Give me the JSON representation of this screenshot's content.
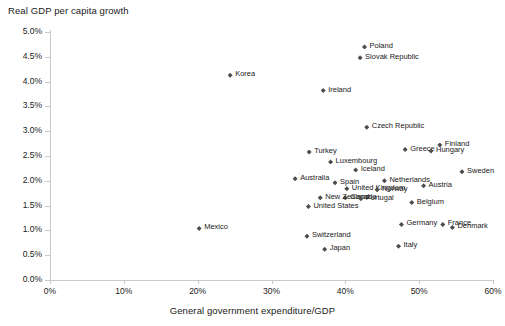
{
  "chart_data": {
    "type": "scatter",
    "title": "Real GDP per capita growth",
    "xlabel": "General government expenditure/GDP",
    "ylabel": "Real GDP per capita growth",
    "xlim": [
      0,
      60
    ],
    "ylim": [
      0,
      5
    ],
    "x_tick_labels": [
      "0%",
      "10%",
      "20%",
      "30%",
      "40%",
      "50%",
      "60%"
    ],
    "x_ticks": [
      0,
      10,
      20,
      30,
      40,
      50,
      60
    ],
    "y_tick_labels": [
      "0.0%",
      "0.5%",
      "1.0%",
      "1.5%",
      "2.0%",
      "2.5%",
      "3.0%",
      "3.5%",
      "4.0%",
      "4.5%",
      "5.0%"
    ],
    "y_ticks": [
      0,
      0.5,
      1.0,
      1.5,
      2.0,
      2.5,
      3.0,
      3.5,
      4.0,
      4.5,
      5.0
    ],
    "grid": false,
    "legend": "none",
    "marker_color": "#4d4d4d",
    "marker_shape": "diamond",
    "axis_color": "#c9c9c9",
    "points": [
      {
        "label": "Poland",
        "x": 42.6,
        "y": 4.7,
        "side": "right"
      },
      {
        "label": "Slovak Republic",
        "x": 42.0,
        "y": 4.48,
        "side": "right"
      },
      {
        "label": "Korea",
        "x": 24.4,
        "y": 4.13,
        "side": "right"
      },
      {
        "label": "Ireland",
        "x": 37.0,
        "y": 3.82,
        "side": "right"
      },
      {
        "label": "Czech Republic",
        "x": 42.9,
        "y": 3.08,
        "side": "right"
      },
      {
        "label": "Finland",
        "x": 52.8,
        "y": 2.72,
        "side": "right"
      },
      {
        "label": "Greece",
        "x": 48.1,
        "y": 2.63,
        "side": "right"
      },
      {
        "label": "Hungary",
        "x": 51.6,
        "y": 2.6,
        "side": "right"
      },
      {
        "label": "Turkey",
        "x": 35.1,
        "y": 2.58,
        "side": "right"
      },
      {
        "label": "Luxembourg",
        "x": 38.0,
        "y": 2.38,
        "side": "right"
      },
      {
        "label": "Iceland",
        "x": 41.4,
        "y": 2.22,
        "side": "right"
      },
      {
        "label": "Sweden",
        "x": 55.8,
        "y": 2.18,
        "side": "right"
      },
      {
        "label": "Australia",
        "x": 33.2,
        "y": 2.04,
        "side": "right"
      },
      {
        "label": "Netherlands",
        "x": 45.3,
        "y": 2.0,
        "side": "right"
      },
      {
        "label": "Spain",
        "x": 38.6,
        "y": 1.96,
        "side": "right"
      },
      {
        "label": "Austria",
        "x": 50.6,
        "y": 1.9,
        "side": "right"
      },
      {
        "label": "United Kingdom",
        "x": 40.2,
        "y": 1.84,
        "side": "right"
      },
      {
        "label": "Norway",
        "x": 44.3,
        "y": 1.82,
        "side": "right"
      },
      {
        "label": "Canada",
        "x": 40.0,
        "y": 1.66,
        "side": "right"
      },
      {
        "label": "New Zealand",
        "x": 36.6,
        "y": 1.66,
        "side": "right"
      },
      {
        "label": "Portugal",
        "x": 42.1,
        "y": 1.64,
        "side": "right"
      },
      {
        "label": "Belgium",
        "x": 49.0,
        "y": 1.56,
        "side": "right"
      },
      {
        "label": "United States",
        "x": 35.0,
        "y": 1.48,
        "side": "right"
      },
      {
        "label": "Germany",
        "x": 47.6,
        "y": 1.12,
        "side": "right"
      },
      {
        "label": "France",
        "x": 53.2,
        "y": 1.12,
        "side": "right"
      },
      {
        "label": "Denmark",
        "x": 54.5,
        "y": 1.06,
        "side": "right"
      },
      {
        "label": "Mexico",
        "x": 20.2,
        "y": 1.04,
        "side": "right"
      },
      {
        "label": "Switzerland",
        "x": 34.8,
        "y": 0.88,
        "side": "right"
      },
      {
        "label": "Italy",
        "x": 47.2,
        "y": 0.68,
        "side": "right"
      },
      {
        "label": "Japan",
        "x": 37.2,
        "y": 0.62,
        "side": "right"
      }
    ]
  }
}
